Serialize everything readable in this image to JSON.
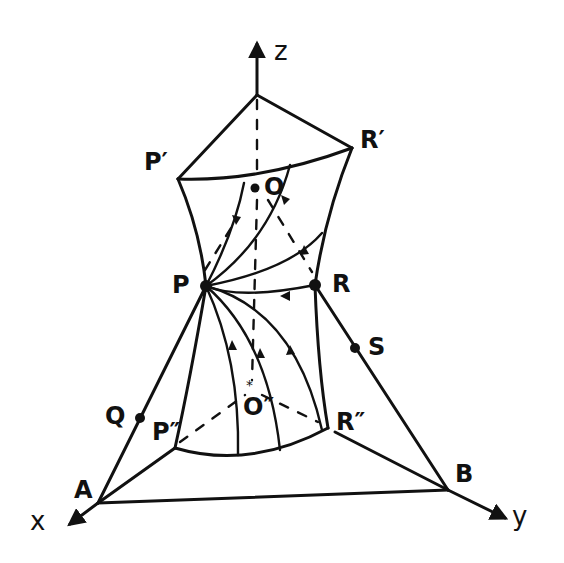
{
  "diagram": {
    "type": "hand-drawn 3D geometry sketch (hyperboloid-like surface with trajectories)",
    "axes": {
      "z": {
        "label": "z"
      },
      "x": {
        "label": "x"
      },
      "y": {
        "label": "y"
      }
    },
    "points": {
      "P": {
        "label": "P"
      },
      "R": {
        "label": "R"
      },
      "P_prime": {
        "label": "P′"
      },
      "R_prime": {
        "label": "R′"
      },
      "P_dprime": {
        "label": "P″"
      },
      "R_dprime": {
        "label": "R″"
      },
      "O": {
        "label": "O"
      },
      "O_dprime": {
        "label": "O″"
      },
      "Q": {
        "label": "Q"
      },
      "S": {
        "label": "S"
      },
      "A": {
        "label": "A"
      },
      "B": {
        "label": "B"
      }
    },
    "stroke_color": "#111111",
    "background_color": "#ffffff"
  }
}
